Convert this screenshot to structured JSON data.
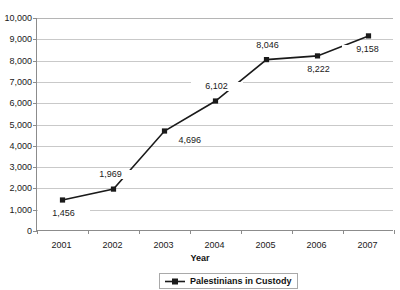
{
  "chart_data": {
    "type": "line",
    "title": "",
    "xlabel": "Year",
    "ylabel": "",
    "categories": [
      "2001",
      "2002",
      "2003",
      "2004",
      "2005",
      "2006",
      "2007"
    ],
    "series": [
      {
        "name": "Palestinians in Custody",
        "values": [
          1456,
          1969,
          4696,
          6102,
          8046,
          8222,
          9158
        ],
        "point_labels": [
          "1,456",
          "1,969",
          "4,696",
          "6,102",
          "8,046",
          "8,222",
          "9,158"
        ],
        "color": "#1a1a1a",
        "marker": "square"
      }
    ],
    "ylim": [
      0,
      10000
    ],
    "y_ticks": [
      0,
      1000,
      2000,
      3000,
      4000,
      5000,
      6000,
      7000,
      8000,
      9000,
      10000
    ],
    "y_tick_labels": [
      "0",
      "1,000",
      "2,000",
      "3,000",
      "4,000",
      "5,000",
      "6,000",
      "7,000",
      "8,000",
      "9,000",
      "10,000"
    ],
    "grid": true,
    "legend_position": "bottom"
  },
  "legend": {
    "entry_label": "Palestinians in Custody"
  },
  "axes": {
    "x_title": "Year"
  },
  "label_offsets": [
    {
      "dx": 0,
      "dy": 14,
      "align": "center"
    },
    {
      "dx": -4,
      "dy": -14,
      "align": "center"
    },
    {
      "dx": 13,
      "dy": 10,
      "align": "left"
    },
    {
      "dx": 0,
      "dy": -14,
      "align": "center"
    },
    {
      "dx": 0,
      "dy": -14,
      "align": "center"
    },
    {
      "dx": 0,
      "dy": 14,
      "align": "center"
    },
    {
      "dx": -2,
      "dy": 14,
      "align": "center"
    }
  ]
}
